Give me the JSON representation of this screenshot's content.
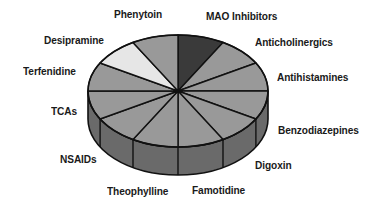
{
  "chart_data": {
    "type": "pie",
    "style": "3d-pie",
    "title": "",
    "categories": [
      "MAO Inhibitors",
      "Anticholinergics",
      "Antihistamines",
      "Benzodiazepines",
      "Digoxin",
      "Famotidine",
      "Theophylline",
      "NSAIDs",
      "TCAs",
      "Terfenidine",
      "Desipramine",
      "Phenytoin"
    ],
    "values": [
      1,
      1,
      1,
      1,
      1,
      1,
      1,
      1,
      1,
      1,
      1,
      1
    ],
    "highlighted": {
      "MAO Inhibitors": "dark",
      "Desipramine": "light"
    },
    "start_angle_deg": 0,
    "direction": "clockwise",
    "legend": "none (labels placed around pie)"
  },
  "labels": [
    {
      "text": "Phenytoin",
      "x": 114,
      "y": 8
    },
    {
      "text": "MAO Inhibitors",
      "x": 206,
      "y": 10
    },
    {
      "text": "Anticholinergics",
      "x": 255,
      "y": 36
    },
    {
      "text": "Desipramine",
      "x": 44,
      "y": 34
    },
    {
      "text": "Antihistamines",
      "x": 277,
      "y": 71
    },
    {
      "text": "Terfenidine",
      "x": 23,
      "y": 65
    },
    {
      "text": "TCAs",
      "x": 51,
      "y": 105
    },
    {
      "text": "Benzodiazepines",
      "x": 278,
      "y": 124
    },
    {
      "text": "NSAIDs",
      "x": 60,
      "y": 153
    },
    {
      "text": "Digoxin",
      "x": 255,
      "y": 159
    },
    {
      "text": "Theophylline",
      "x": 107,
      "y": 185
    },
    {
      "text": "Famotidine",
      "x": 192,
      "y": 184
    }
  ],
  "colors": {
    "slice_default": "#999999",
    "slice_dark": "#3a3a3a",
    "slice_light": "#e6e6e6",
    "side": "#6a6a6a",
    "outline": "#111111"
  }
}
